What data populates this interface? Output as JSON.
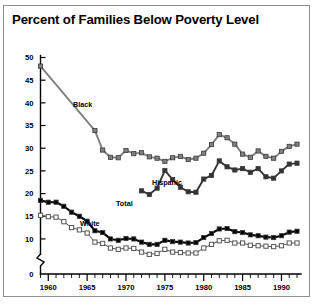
{
  "title": "Percent of Families Below Poverty Level",
  "axis": {
    "y_ticks": [
      "0",
      "10",
      "15",
      "20",
      "25",
      "30",
      "35",
      "40",
      "45",
      "50"
    ],
    "x_ticks": [
      "1960",
      "1965",
      "1970",
      "1975",
      "1980",
      "1985",
      "1990"
    ],
    "y_break_note": "axis break between 0 and 10"
  },
  "series_labels": {
    "black": "Black",
    "hispanic": "Hispanic",
    "total": "Total",
    "white": "White"
  },
  "colors": {
    "black_series": "#808080",
    "hispanic_series": "#333333",
    "total_series": "#000000",
    "white_series": "#ffffff",
    "white_series_edge": "#555555",
    "frame": "#8d8d8d",
    "text": "#000000"
  },
  "chart_data": {
    "type": "line",
    "title": "Percent of Families Below Poverty Level",
    "xlabel": "",
    "ylabel": "Percent",
    "xlim": [
      1959,
      1992
    ],
    "ylim": [
      8,
      50
    ],
    "y_axis_break": [
      0,
      8
    ],
    "grid": false,
    "legend": "inline-labels",
    "x_tick_labels": [
      "1960",
      "1965",
      "1970",
      "1975",
      "1980",
      "1985",
      "1990"
    ],
    "x_major_ticks": [
      1960,
      1965,
      1970,
      1975,
      1980,
      1985,
      1990
    ],
    "y_tick_values": [
      0,
      10,
      15,
      20,
      25,
      30,
      35,
      40,
      45,
      50
    ],
    "series": [
      {
        "name": "Black",
        "marker": "filled-square-gray",
        "color": "#808080",
        "x": [
          1959,
          1966,
          1967,
          1968,
          1969,
          1970,
          1971,
          1972,
          1973,
          1974,
          1975,
          1976,
          1977,
          1978,
          1979,
          1980,
          1981,
          1982,
          1983,
          1984,
          1985,
          1986,
          1987,
          1988,
          1989,
          1990,
          1991,
          1992
        ],
        "values": [
          48.1,
          33.9,
          29.6,
          28.0,
          27.9,
          29.5,
          28.8,
          29.0,
          28.1,
          27.8,
          27.1,
          27.9,
          28.2,
          27.5,
          27.8,
          28.9,
          30.8,
          33.0,
          32.3,
          30.9,
          28.7,
          28.0,
          29.4,
          28.2,
          27.8,
          29.3,
          30.4,
          30.9
        ]
      },
      {
        "name": "Hispanic",
        "marker": "filled-square-dark",
        "color": "#333333",
        "x": [
          1972,
          1973,
          1974,
          1975,
          1976,
          1977,
          1978,
          1979,
          1980,
          1981,
          1982,
          1983,
          1984,
          1985,
          1986,
          1987,
          1988,
          1989,
          1990,
          1991,
          1992
        ],
        "values": [
          20.6,
          19.8,
          21.2,
          25.1,
          23.1,
          21.4,
          20.4,
          20.3,
          23.2,
          24.0,
          27.2,
          25.9,
          25.2,
          25.5,
          24.7,
          25.5,
          23.7,
          23.4,
          25.0,
          26.5,
          26.7
        ]
      },
      {
        "name": "Total",
        "marker": "filled-square-black",
        "color": "#000000",
        "x": [
          1959,
          1960,
          1961,
          1962,
          1963,
          1964,
          1965,
          1966,
          1967,
          1968,
          1969,
          1970,
          1971,
          1972,
          1973,
          1974,
          1975,
          1976,
          1977,
          1978,
          1979,
          1980,
          1981,
          1982,
          1983,
          1984,
          1985,
          1986,
          1987,
          1988,
          1989,
          1990,
          1991,
          1992
        ],
        "values": [
          18.5,
          18.1,
          18.1,
          17.2,
          15.9,
          15.0,
          13.9,
          11.8,
          11.4,
          10.0,
          9.7,
          10.1,
          10.0,
          9.3,
          8.8,
          8.8,
          9.7,
          9.4,
          9.3,
          9.1,
          9.2,
          10.3,
          11.2,
          12.2,
          12.3,
          11.6,
          11.4,
          10.9,
          10.7,
          10.4,
          10.3,
          10.7,
          11.5,
          11.7
        ]
      },
      {
        "name": "White",
        "marker": "open-square",
        "color": "#ffffff",
        "x": [
          1959,
          1960,
          1961,
          1962,
          1963,
          1964,
          1965,
          1966,
          1967,
          1968,
          1969,
          1970,
          1971,
          1972,
          1973,
          1974,
          1975,
          1976,
          1977,
          1978,
          1979,
          1980,
          1981,
          1982,
          1983,
          1984,
          1985,
          1986,
          1987,
          1988,
          1989,
          1990,
          1991,
          1992
        ],
        "values": [
          15.2,
          14.9,
          14.8,
          13.8,
          12.5,
          12.0,
          11.3,
          9.3,
          9.0,
          8.0,
          7.7,
          8.0,
          7.9,
          7.1,
          6.6,
          6.8,
          7.7,
          7.1,
          7.0,
          6.9,
          6.9,
          8.0,
          8.8,
          9.6,
          9.7,
          9.1,
          9.1,
          8.6,
          8.5,
          8.4,
          8.3,
          8.5,
          9.1,
          9.1
        ]
      }
    ]
  }
}
